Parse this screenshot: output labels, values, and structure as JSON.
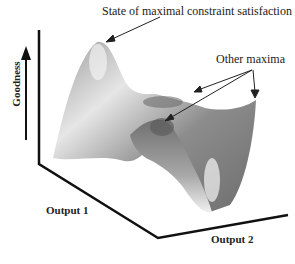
{
  "annotations": {
    "global_max": "State of maximal constraint satisfaction",
    "other_maxima": "Other maxima"
  },
  "axes": {
    "y_label": "Goodness",
    "x1_label": "Output 1",
    "x2_label": "Output 2"
  },
  "colors": {
    "axis": "#111111",
    "surface_dark": "#5a5a5a",
    "surface_mid": "#8a8a8a",
    "surface_light": "#e8e8e8"
  }
}
